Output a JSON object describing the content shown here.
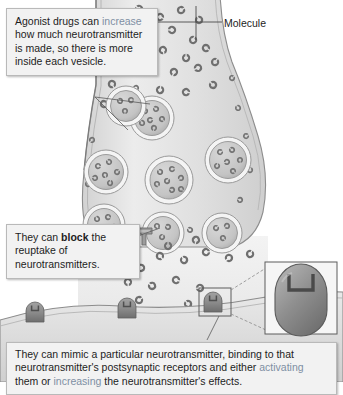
{
  "figure": {
    "type": "biological-diagram",
    "palette": {
      "background": "#ffffff",
      "terminal_fill": "#e3e3e3",
      "terminal_edge": "#8d8d8d",
      "vesicle_ring": "#f4f4f4",
      "vesicle_fill": "#c9c9c9",
      "molecule": "#6f6f6f",
      "receptor": "#8a8a8a",
      "postsynaptic_fill": "#dcdcdc",
      "cleft_fill": "#efefef",
      "callout_bg": "#f2f2f2",
      "callout_border": "#b9b9b9",
      "highlight_text": "#7e8fa3",
      "body_text": "#1d1d1d"
    }
  },
  "labels": {
    "molecule": "Molecule"
  },
  "callouts": {
    "agonist": {
      "line1": "Agonist drugs can ",
      "highlight": "increase",
      "line2": " how much neurotransmitter is made, so there is more inside each vesicle."
    },
    "block": {
      "line1": "They can ",
      "bold": "block",
      "line2": " the reuptake of neurotransmitters."
    },
    "mimic": {
      "line1": "They can mimic a particular neurotransmitter, binding to that neurotransmitter's postsynaptic receptors and either ",
      "highlight1": "activating",
      "line2": " them or ",
      "highlight2": "increasing",
      "line3": " the neurotransmitter's effects."
    }
  },
  "structures": {
    "axon_terminal": "axon-terminal",
    "vesicles": "synaptic-vesicles",
    "free_molecules": "neurotransmitter-molecules",
    "reuptake_transporter": "reuptake-transporter",
    "synaptic_cleft": "synaptic-cleft",
    "postsynaptic_membrane": "postsynaptic-membrane",
    "receptors": "postsynaptic-receptors",
    "inset": "receptor-detail-inset"
  }
}
